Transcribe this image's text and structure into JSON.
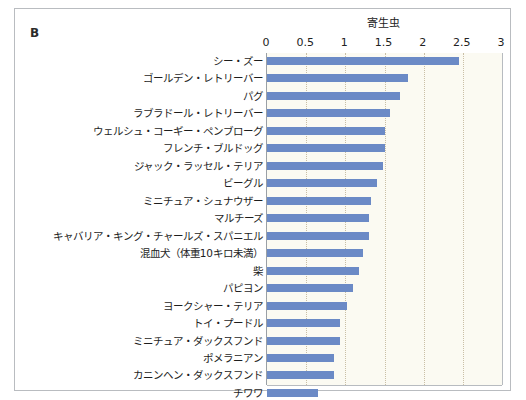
{
  "panel": {
    "letter": "B"
  },
  "chart_data": {
    "type": "bar",
    "orientation": "horizontal",
    "title": "寄生虫",
    "xlabel": "",
    "ylabel": "",
    "xlim": [
      0,
      3
    ],
    "xticks": [
      "0",
      "0.5",
      "1",
      "1.5",
      "2",
      "2.5",
      "3"
    ],
    "xtick_values": [
      0,
      0.5,
      1,
      1.5,
      2,
      2.5,
      3
    ],
    "grid": true,
    "legend": "none",
    "bar_color": "#6b8ac6",
    "plot_background": "#fbfaf2",
    "gridline_color": "#c9bfa6",
    "categories": [
      "シー・ズー",
      "ゴールデン・レトリーバー",
      "パグ",
      "ラブラドール・レトリーバー",
      "ウェルシュ・コーギー・ペンブローグ",
      "フレンチ・ブルドッグ",
      "ジャック・ラッセル・テリア",
      "ビーグル",
      "ミニチュア・シュナウザー",
      "マルチーズ",
      "キャバリア・キング・チャールズ・スパニエル",
      "混血犬（体重10キロ未満）",
      "柴",
      "パピヨン",
      "ヨークシャー・テリア",
      "トイ・プードル",
      "ミニチュア・ダックスフンド",
      "ポメラニアン",
      "カニンヘン・ダックスフンド",
      "チワワ"
    ],
    "values": [
      2.45,
      1.8,
      1.7,
      1.57,
      1.5,
      1.5,
      1.48,
      1.4,
      1.33,
      1.3,
      1.3,
      1.22,
      1.18,
      1.1,
      1.02,
      0.93,
      0.93,
      0.85,
      0.85,
      0.65
    ]
  }
}
